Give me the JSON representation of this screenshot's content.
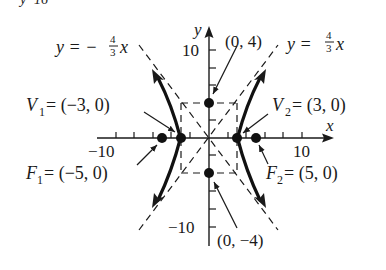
{
  "diagram": {
    "type": "hyperbola",
    "equation_cutoff_top": "y²   16",
    "axes": {
      "x_label": "x",
      "y_label": "y",
      "x_tick_labels": {
        "neg": "−10",
        "pos": "10"
      },
      "y_tick_labels": {
        "pos": "10",
        "neg": "−10"
      }
    },
    "asymptotes": [
      {
        "label_lhs": "y = −",
        "num": "4",
        "den": "3",
        "var": "x",
        "slope": -1.3333
      },
      {
        "label_lhs": "y = ",
        "num": "4",
        "den": "3",
        "var": "x",
        "slope": 1.3333
      }
    ],
    "points": {
      "co_vertex_top": {
        "label": "(0, 4)",
        "x": 0,
        "y": 4
      },
      "co_vertex_bottom": {
        "label": "(0, −4)",
        "x": 0,
        "y": -4
      },
      "v1": {
        "name": "V",
        "sub": "1",
        "value": " = (−3, 0)",
        "x": -3,
        "y": 0
      },
      "v2": {
        "name": "V",
        "sub": "2",
        "value": " = (3, 0)",
        "x": 3,
        "y": 0
      },
      "f1": {
        "name": "F",
        "sub": "1",
        "value": " = (−5, 0)",
        "x": -5,
        "y": 0
      },
      "f2": {
        "name": "F",
        "sub": "2",
        "value": " = (5, 0)",
        "x": 5,
        "y": 0
      }
    },
    "colors": {
      "ink": "#1a1a1a",
      "background": "#ffffff"
    }
  }
}
